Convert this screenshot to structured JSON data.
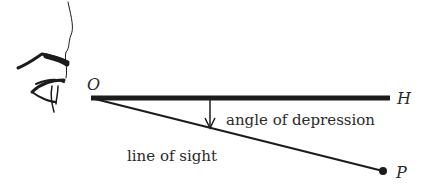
{
  "diagram": {
    "title": "Angle of depression",
    "points": {
      "O": {
        "label": "O",
        "x": 91,
        "y": 98
      },
      "H": {
        "label": "H",
        "x": 390,
        "y": 98
      },
      "P": {
        "label": "P",
        "x": 383,
        "y": 171
      }
    },
    "labels": {
      "angle": "angle of depression",
      "sight": "line of sight"
    },
    "icons": {
      "eye": "eye-icon"
    },
    "colors": {
      "ink": "#1c1c1c",
      "text": "#2a2a2a",
      "background": "#ffffff"
    }
  }
}
